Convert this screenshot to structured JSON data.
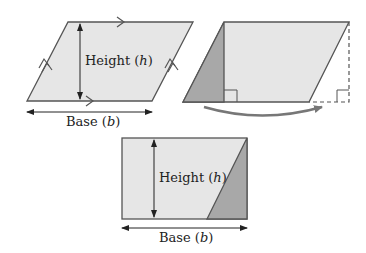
{
  "diagram": {
    "figures": [
      {
        "id": "parallelogram",
        "height_label": "Height",
        "height_var": "h",
        "base_label": "Base",
        "base_var": "b"
      },
      {
        "id": "parallelogram-cut",
        "note": "triangle cut and moved to the right"
      },
      {
        "id": "rectangle",
        "height_label": "Height",
        "height_var": "h",
        "base_label": "Base",
        "base_var": "b"
      }
    ],
    "colors": {
      "fill": "#e6e6e6",
      "shade": "#a8a8a8",
      "stroke": "#555555",
      "arrow": "#777777"
    }
  }
}
